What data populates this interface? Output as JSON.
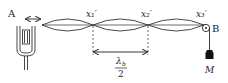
{
  "diagram": {
    "labels": {
      "end_a": "A",
      "end_b": "B",
      "mass": "M",
      "node_1": "x₁′",
      "node_2": "x₂′",
      "node_3": "x₃′",
      "half_wavelength_numerator": "λ",
      "half_wavelength_subscript": "b",
      "half_wavelength_denominator": "2"
    },
    "loops": 3,
    "components": [
      "tuning-fork",
      "string",
      "pulley",
      "hanging-mass"
    ],
    "colors": {
      "ink": "#222222",
      "background": "#ffffff"
    }
  }
}
